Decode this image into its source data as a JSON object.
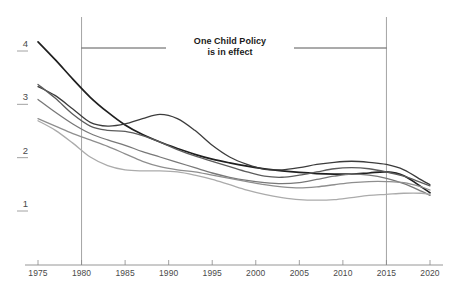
{
  "chart_data": {
    "type": "line",
    "title": "",
    "subtitle": "",
    "xlabel": "",
    "ylabel": "",
    "xlim": [
      1975,
      2021
    ],
    "ylim": [
      0.55,
      4.35
    ],
    "grid": false,
    "legend": "none",
    "x_ticks": [
      "1975",
      "1980",
      "1985",
      "1990",
      "1995",
      "2000",
      "2005",
      "2010",
      "2015",
      "2020"
    ],
    "x_tick_values": [
      1975,
      1980,
      1985,
      1990,
      1995,
      2000,
      2005,
      2010,
      2015,
      2020
    ],
    "y_ticks": [
      "4",
      "3",
      "2",
      "1"
    ],
    "y_tick_values": [
      4,
      3,
      2,
      1
    ],
    "annotations": [
      {
        "name": "one-child-policy",
        "line1": "One Child Policy",
        "line2": "is in effect",
        "span_start": 1980,
        "span_end": 2015
      }
    ],
    "reference_lines": [
      {
        "name": "policy-start",
        "orientation": "vertical",
        "value": 1980,
        "color": "#9a9a9a"
      },
      {
        "name": "policy-end",
        "orientation": "vertical",
        "value": 2015,
        "color": "#9a9a9a"
      }
    ],
    "x": [
      1975,
      1977,
      1979,
      1981,
      1983,
      1985,
      1987,
      1989,
      1991,
      1993,
      1995,
      1997,
      1999,
      2001,
      2003,
      2005,
      2007,
      2009,
      2011,
      2013,
      2015,
      2017,
      2019,
      2020
    ],
    "series": [
      {
        "name": "series-a",
        "color": "#1f1f1f",
        "width": 1.7,
        "values": [
          4.06,
          3.72,
          3.36,
          3.02,
          2.74,
          2.5,
          2.32,
          2.18,
          2.06,
          1.95,
          1.86,
          1.79,
          1.73,
          1.68,
          1.64,
          1.61,
          1.59,
          1.58,
          1.58,
          1.6,
          1.62,
          1.55,
          1.34,
          1.23
        ]
      },
      {
        "name": "series-b",
        "color": "#3c3c3c",
        "width": 1.3,
        "values": [
          3.22,
          3.05,
          2.8,
          2.55,
          2.48,
          2.52,
          2.62,
          2.7,
          2.62,
          2.4,
          2.12,
          1.9,
          1.76,
          1.67,
          1.66,
          1.7,
          1.76,
          1.8,
          1.82,
          1.8,
          1.76,
          1.66,
          1.47,
          1.38
        ]
      },
      {
        "name": "series-c",
        "color": "#5c5c5c",
        "width": 1.3,
        "values": [
          3.26,
          3.0,
          2.7,
          2.48,
          2.4,
          2.38,
          2.3,
          2.18,
          2.04,
          1.92,
          1.82,
          1.72,
          1.62,
          1.54,
          1.52,
          1.56,
          1.62,
          1.68,
          1.7,
          1.68,
          1.62,
          1.54,
          1.42,
          1.36
        ]
      },
      {
        "name": "series-d",
        "color": "#787878",
        "width": 1.3,
        "values": [
          2.98,
          2.74,
          2.52,
          2.34,
          2.22,
          2.12,
          2.0,
          1.9,
          1.8,
          1.7,
          1.6,
          1.52,
          1.46,
          1.42,
          1.4,
          1.42,
          1.48,
          1.54,
          1.58,
          1.56,
          1.5,
          1.4,
          1.26,
          1.18
        ]
      },
      {
        "name": "series-e",
        "color": "#8e8e8e",
        "width": 1.3,
        "values": [
          2.62,
          2.48,
          2.34,
          2.22,
          2.1,
          1.96,
          1.82,
          1.72,
          1.66,
          1.62,
          1.56,
          1.5,
          1.44,
          1.38,
          1.34,
          1.32,
          1.34,
          1.38,
          1.42,
          1.44,
          1.44,
          1.42,
          1.34,
          1.28
        ]
      },
      {
        "name": "series-f",
        "color": "#ababab",
        "width": 1.3,
        "values": [
          2.58,
          2.4,
          2.16,
          1.9,
          1.74,
          1.66,
          1.64,
          1.64,
          1.62,
          1.56,
          1.48,
          1.38,
          1.28,
          1.2,
          1.14,
          1.1,
          1.09,
          1.1,
          1.14,
          1.18,
          1.2,
          1.22,
          1.22,
          1.2
        ]
      }
    ]
  },
  "axis": {
    "x_axis_color": "#8a8a8a",
    "tick_color": "#8a8a8a",
    "label_color": "#4a4a4a"
  }
}
